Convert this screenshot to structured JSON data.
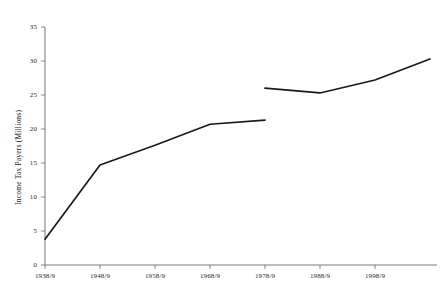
{
  "chart_data": {
    "type": "line",
    "title": "",
    "xlabel": "",
    "ylabel": "Income Tax Payers (Millions)",
    "categories": [
      "1938/9",
      "1948/9",
      "1958/9",
      "1968/9",
      "1978/9",
      "1988/9",
      "1998/9",
      "2008/9"
    ],
    "x_tick_labels": [
      "1938/9",
      "1948/9",
      "1958/9",
      "1968/9",
      "1978/9",
      "1988/9",
      "1998/9"
    ],
    "y_tick_labels": [
      "0",
      "5",
      "10",
      "15",
      "20",
      "25",
      "30",
      "35"
    ],
    "y_ticks": [
      0,
      5,
      10,
      15,
      20,
      25,
      30,
      35
    ],
    "ylim": [
      0,
      35
    ],
    "grid": false,
    "legend": "none",
    "line_color": "#1a1a1a",
    "axis_color": "#555555",
    "background_color": "#ffffff",
    "series": [
      {
        "name": "Income tax payers (pre-1978/9 basis)",
        "points": [
          {
            "x": "1938/9",
            "y": 3.8
          },
          {
            "x": "1948/9",
            "y": 14.7
          },
          {
            "x": "1958/9",
            "y": 17.6
          },
          {
            "x": "1968/9",
            "y": 20.7
          },
          {
            "x": "1978/9",
            "y": 21.3
          }
        ]
      },
      {
        "name": "Income tax payers (post-1978/9 basis)",
        "points": [
          {
            "x": "1978/9",
            "y": 26.0
          },
          {
            "x": "1988/9",
            "y": 25.3
          },
          {
            "x": "1998/9",
            "y": 27.2
          },
          {
            "x": "2008/9",
            "y": 30.3
          }
        ]
      }
    ],
    "note": "Series is discontinuous at 1978/9; line breaks and restarts at a higher value."
  },
  "axis": {
    "y_title": "Income Tax Payers (Millions)"
  }
}
